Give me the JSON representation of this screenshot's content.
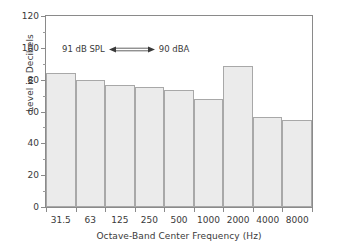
{
  "chart_data": {
    "type": "bar",
    "title": "",
    "xlabel": "Octave-Band Center Frequency (Hz)",
    "ylabel": "Level in Decibels",
    "categories": [
      "31.5",
      "63",
      "125",
      "250",
      "500",
      "1000",
      "2000",
      "4000",
      "8000"
    ],
    "values": [
      84.5,
      79.5,
      76.5,
      75.5,
      73.5,
      68,
      88.5,
      56.5,
      54.5
    ],
    "ylim": [
      0,
      120
    ],
    "ytick_labels": [
      "0",
      "20",
      "40",
      "60",
      "80",
      "100",
      "120"
    ],
    "ytick_values": [
      0,
      20,
      40,
      60,
      80,
      100,
      120
    ],
    "yminor_values": [
      10,
      30,
      50,
      70,
      90,
      110
    ],
    "grid": false,
    "legend": "none",
    "bar_fill": "#ebebeb",
    "bar_border": "#a8a8a8",
    "axis_color": "#8a8a8a",
    "annotations": [
      {
        "left_text": "91 dB SPL",
        "right_text": "90 dBA",
        "arrow": "double-headed-arrow"
      }
    ]
  }
}
